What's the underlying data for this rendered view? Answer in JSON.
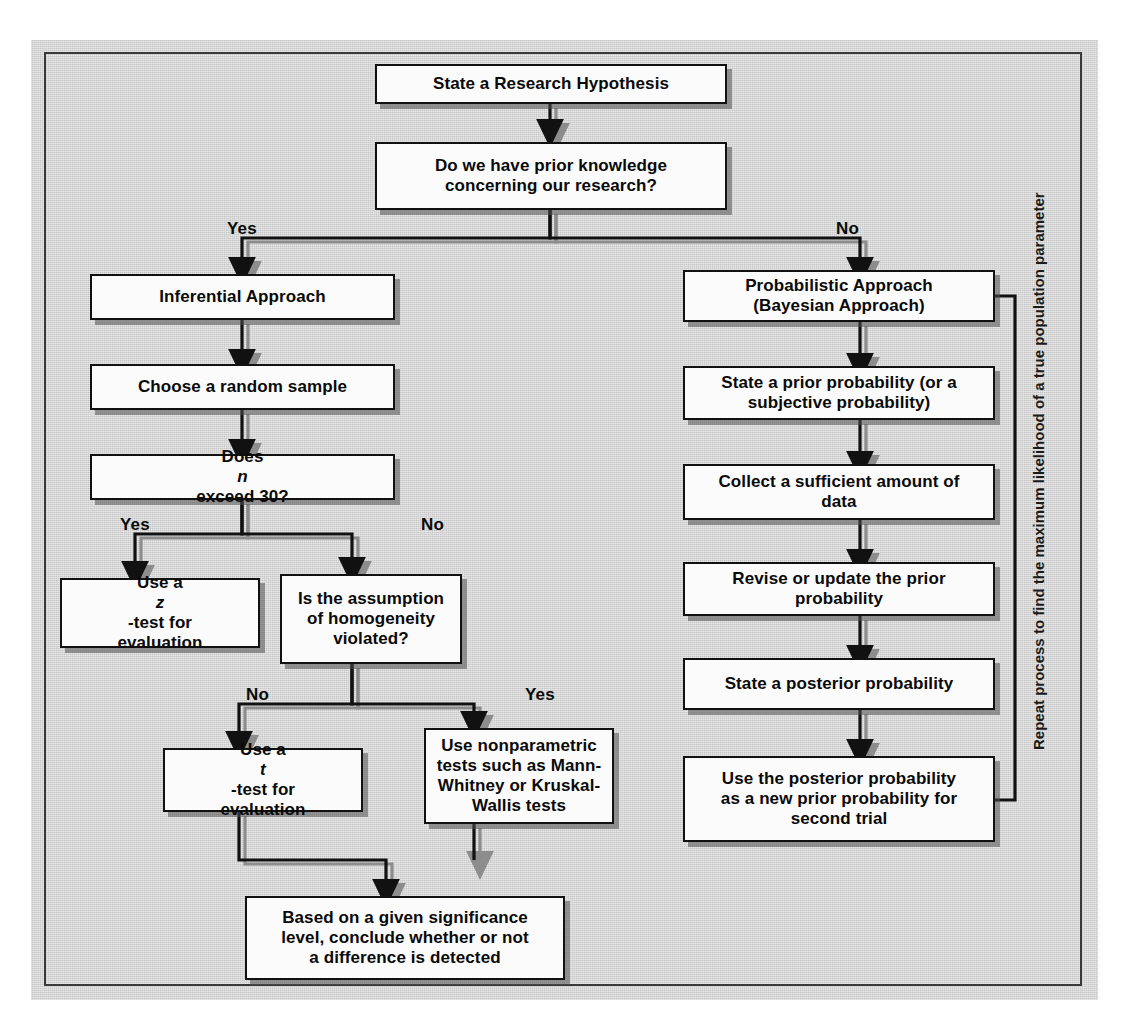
{
  "figure": {
    "kind": "flowchart",
    "panel_color": "#d2d2d2",
    "box_fill": "#fbfbfb",
    "line_color": "#111111",
    "shadow_color": "#6e6e6e"
  },
  "nodes": {
    "hypothesis": "State a Research Hypothesis",
    "prior_knowledge_line1": "Do we have prior knowledge",
    "prior_knowledge_line2": "concerning our research?",
    "inferential": "Inferential Approach",
    "random_sample": "Choose a random sample",
    "n_exceed_pre": "Does ",
    "n_exceed_var": "n",
    "n_exceed_post": " exceed 30?",
    "ztest_pre": "Use a ",
    "ztest_var": "z",
    "ztest_post": "-test for",
    "ztest_line2": "evaluation",
    "homogeneity_line1": "Is the assumption",
    "homogeneity_line2": "of homogeneity",
    "homogeneity_line3": "violated?",
    "ttest_pre": "Use a ",
    "ttest_var": "t",
    "ttest_post": "-test for",
    "ttest_line2": "evaluation",
    "nonparam_line1": "Use nonparametric",
    "nonparam_line2": "tests such as Mann-",
    "nonparam_line3": "Whitney or Kruskal-",
    "nonparam_line4": "Wallis tests",
    "conclude_line1": "Based on a given significance",
    "conclude_line2": "level, conclude whether or not",
    "conclude_line3": "a difference is detected",
    "probabilistic_line1": "Probabilistic Approach",
    "probabilistic_line2": "(Bayesian Approach)",
    "prior_prob_line1": "State a prior probability (or a",
    "prior_prob_line2": "subjective probability)",
    "collect_line1": "Collect a sufficient amount of",
    "collect_line2": "data",
    "revise_line1": "Revise or update the prior",
    "revise_line2": "probability",
    "posterior": "State a posterior probability",
    "reuse_line1": "Use the posterior probability",
    "reuse_line2": "as a new prior probability for",
    "reuse_line3": "second trial"
  },
  "branch_labels": {
    "root_yes": "Yes",
    "root_no": "No",
    "n_yes": "Yes",
    "n_no": "No",
    "homog_no": "No",
    "homog_yes": "Yes"
  },
  "loop_caption": {
    "line1": "Repeat process to find the maximum likelihood",
    "line2": "of a true population parameter"
  }
}
